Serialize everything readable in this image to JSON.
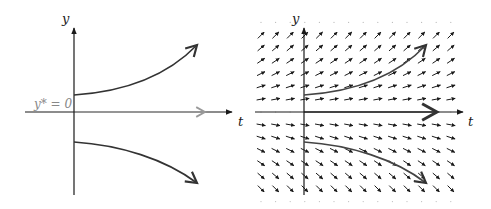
{
  "left_panel": {
    "y_axis_label": "y",
    "t_axis_label": "t",
    "equilibrium_label": "y* = 0",
    "equilibrium_color": "#888888",
    "axis_color": "#1a1a1a",
    "curve_color": "#333333",
    "description": "Solution curves diverging from unstable equilibrium y*=0"
  },
  "right_panel": {
    "y_axis_label": "y",
    "t_axis_label": "t",
    "axis_color": "#1a1a1a",
    "curve_color": "#444444",
    "arrow_color": "#1a1a1a",
    "grid_columns": 14,
    "grid_rows_above": 6,
    "grid_rows_below": 6,
    "description": "Direction field with solution curves for dy/dt = k*y, k>0"
  }
}
